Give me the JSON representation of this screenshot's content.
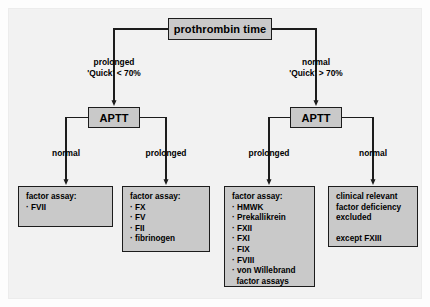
{
  "diagram": {
    "colors": {
      "panel_background": "#f2f2f2",
      "node_fill": "#c9c9c9",
      "node_border": "#1c1c1c",
      "connector": "#1c1c1c",
      "text": "#000000"
    }
  },
  "nodes": {
    "root": {
      "label": "prothrombin time"
    },
    "aptt_left": {
      "label": "APTT"
    },
    "aptt_right": {
      "label": "APTT"
    }
  },
  "edges": {
    "root_left": {
      "line1": "prolonged",
      "line2": "'Quick' < 70%"
    },
    "root_right": {
      "line1": "normal",
      "line2": "'Quick' > 70%"
    },
    "aptt_left_left": {
      "label": "normal"
    },
    "aptt_left_right": {
      "label": "prolonged"
    },
    "aptt_right_left": {
      "label": "prolonged"
    },
    "aptt_right_right": {
      "label": "normal"
    }
  },
  "leaves": [
    {
      "heading": "factor assay:",
      "items": [
        "FVII"
      ]
    },
    {
      "heading": "factor assay:",
      "items": [
        "FX",
        "FV",
        "FII",
        "fibrinogen"
      ]
    },
    {
      "heading": "factor assay:",
      "items": [
        "HMWK",
        "Prekallikrein",
        "FXII",
        "FXI",
        "FIX",
        "FVIII",
        "von Willebrand"
      ],
      "continuation": "factor assays"
    },
    {
      "lines": [
        "clinical relevant",
        "factor deficiency",
        "excluded"
      ],
      "footer": "except FXIII"
    }
  ]
}
